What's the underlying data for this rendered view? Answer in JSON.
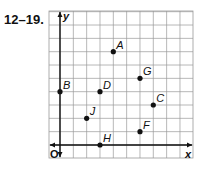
{
  "problem_label": "12–19.",
  "graph": {
    "x_axis_label": "x",
    "y_axis_label": "y",
    "origin_label": "O",
    "x_range": [
      -1,
      10
    ],
    "y_range": [
      -1,
      10
    ],
    "grid_step": 1,
    "points": [
      {
        "label": "A",
        "x": 4,
        "y": 7
      },
      {
        "label": "B",
        "x": 0,
        "y": 4
      },
      {
        "label": "C",
        "x": 7,
        "y": 3
      },
      {
        "label": "D",
        "x": 3,
        "y": 4
      },
      {
        "label": "F",
        "x": 6,
        "y": 1
      },
      {
        "label": "G",
        "x": 6,
        "y": 5
      },
      {
        "label": "H",
        "x": 3,
        "y": 0
      },
      {
        "label": "J",
        "x": 2,
        "y": 2
      }
    ]
  }
}
